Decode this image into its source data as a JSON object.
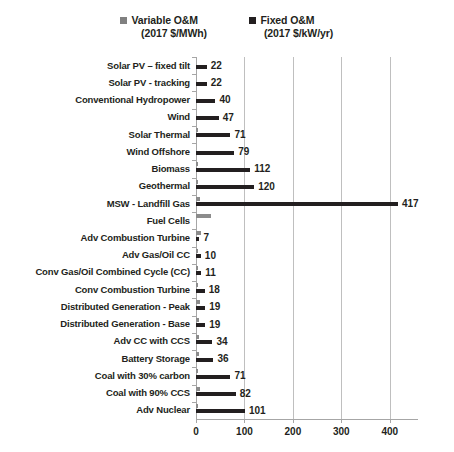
{
  "legend": {
    "items": [
      {
        "label": "Variable O&M",
        "units": "(2017 $/MWh)",
        "color": "#8c8c8c",
        "key": "variable"
      },
      {
        "label": "Fixed O&M",
        "units": "(2017 $/kW/yr)",
        "color": "#231f20",
        "key": "fixed"
      }
    ]
  },
  "chart_data": {
    "type": "bar",
    "orientation": "horizontal",
    "title": "",
    "xlabel": "",
    "ylabel": "",
    "xlim": [
      0,
      450
    ],
    "xticks": [
      0,
      100,
      200,
      300,
      400
    ],
    "xticklabels": [
      "0",
      "100",
      "200",
      "300",
      "400"
    ],
    "grid": true,
    "legend_position": "top",
    "categories": [
      "Solar PV – fixed tilt",
      "Solar PV - tracking",
      "Conventional Hydropower",
      "Wind",
      "Solar Thermal",
      "Wind Offshore",
      "Biomass",
      "Geothermal",
      "MSW - Landfill Gas",
      "Fuel Cells",
      "Adv Combustion Turbine",
      "Adv Gas/Oil CC",
      "Conv Gas/Oil Combined Cycle (CC)",
      "Conv Combustion Turbine",
      "Distributed Generation - Peak",
      "Distributed Generation - Base",
      "Adv CC with CCS",
      "Battery Storage",
      "Coal with 30% carbon",
      "Coal with 90% CCS",
      "Adv Nuclear"
    ],
    "series": [
      {
        "name": "Variable O&M",
        "units": "2017 $/MWh",
        "color": "#8c8c8c",
        "values": [
          0,
          0,
          0,
          0,
          4,
          0,
          5,
          1,
          9,
          30,
          11,
          2,
          3,
          4,
          8,
          7,
          7,
          6,
          5,
          9,
          2
        ],
        "labels": [
          "",
          "",
          "",
          "",
          "",
          "",
          "",
          "",
          "",
          "",
          "",
          "",
          "",
          "",
          "",
          "",
          "",
          "",
          "",
          "",
          ""
        ]
      },
      {
        "name": "Fixed O&M",
        "units": "2017 $/kW/yr",
        "color": "#231f20",
        "values": [
          22,
          22,
          40,
          47,
          71,
          79,
          112,
          120,
          417,
          0,
          7,
          10,
          11,
          18,
          19,
          19,
          34,
          36,
          71,
          82,
          101
        ],
        "labels": [
          "22",
          "22",
          "40",
          "47",
          "71",
          "79",
          "112",
          "120",
          "417",
          "",
          "7",
          "10",
          "11",
          "18",
          "19",
          "19",
          "34",
          "36",
          "71",
          "82",
          "101"
        ]
      }
    ]
  }
}
